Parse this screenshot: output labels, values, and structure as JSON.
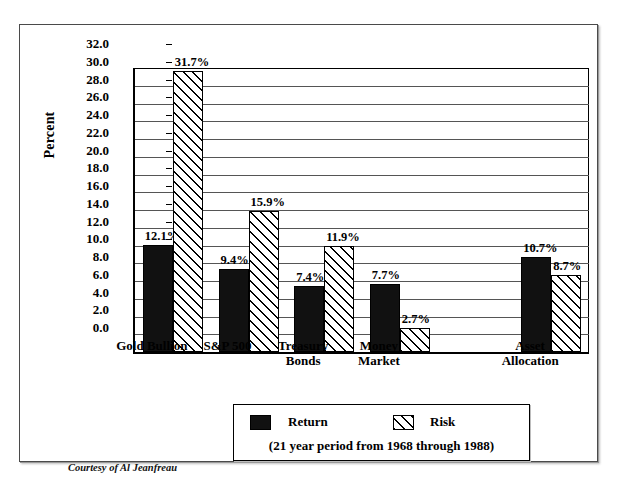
{
  "chart_data": {
    "type": "bar",
    "title": "",
    "xlabel": "",
    "ylabel": "Percent",
    "ylim": [
      0.0,
      32.0
    ],
    "ytick_step": 2.0,
    "grid": true,
    "legend_position": "bottom-center",
    "categories": [
      "Gold Bullion",
      "S&P 500",
      "Treasury\nBonds",
      "Money\nMarket",
      "",
      "Asset\nAllocation"
    ],
    "ytick_labels": [
      "32.0",
      "30.0",
      "28.0",
      "26.0",
      "24.0",
      "22.0",
      "20.0",
      "18.0",
      "16.0",
      "14.0",
      "12.0",
      "10.0",
      "8.0",
      "6.0",
      "4.0",
      "2.0",
      "0.0"
    ],
    "series": [
      {
        "name": "Return",
        "style": "solid-black",
        "values": [
          12.1,
          9.4,
          7.4,
          7.7,
          null,
          10.7
        ],
        "labels": [
          "12.1%",
          "9.4%",
          "7.4%",
          "7.7%",
          "",
          "10.7%"
        ]
      },
      {
        "name": "Risk",
        "style": "diagonal-hatch",
        "values": [
          31.7,
          15.9,
          11.9,
          2.7,
          null,
          8.7
        ],
        "labels": [
          "31.7%",
          "15.9%",
          "11.9%",
          "2.7%",
          "",
          "8.7%"
        ]
      }
    ],
    "annotations": [
      "(21 year period from 1968 through 1988)",
      "Courtesy of Al Jeanfreau"
    ]
  },
  "axis": {
    "y_title": "Percent"
  },
  "legend": {
    "return_label": "Return",
    "risk_label": "Risk",
    "caption": "(21 year period from 1968 through 1988)"
  },
  "footer": {
    "courtesy": "Courtesy of Al Jeanfreau"
  }
}
